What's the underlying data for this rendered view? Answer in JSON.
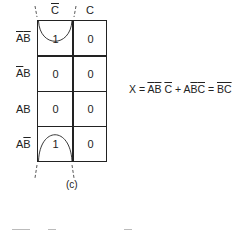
{
  "kmap": {
    "column_headers": [
      {
        "text": "C",
        "overbar": true
      },
      {
        "text": "C",
        "overbar": false
      }
    ],
    "row_headers": [
      {
        "parts": [
          {
            "t": "A",
            "bar": true
          },
          {
            "t": "B",
            "bar": true
          }
        ]
      },
      {
        "parts": [
          {
            "t": "A",
            "bar": true
          },
          {
            "t": "B",
            "bar": false
          }
        ]
      },
      {
        "parts": [
          {
            "t": "A",
            "bar": false
          },
          {
            "t": "B",
            "bar": false
          }
        ]
      },
      {
        "parts": [
          {
            "t": "A",
            "bar": false
          },
          {
            "t": "B",
            "bar": true
          }
        ]
      }
    ],
    "cells": [
      [
        "1",
        "0"
      ],
      [
        "0",
        "0"
      ],
      [
        "0",
        "0"
      ],
      [
        "1",
        "0"
      ]
    ],
    "grouping": "wrap-around loop of C-bar column cells in rows 1 and 4",
    "caption": "(c)"
  },
  "equation": {
    "lhs": "X",
    "eq1": "=",
    "term1": [
      {
        "t": "A",
        "bar": true
      },
      {
        "t": "B",
        "bar": true
      },
      {
        "t": "C",
        "bar": true
      }
    ],
    "plus": "+",
    "term2": [
      {
        "t": "A",
        "bar": false
      },
      {
        "t": "B",
        "bar": true
      },
      {
        "t": "C",
        "bar": true
      }
    ],
    "eq2": "=",
    "result": [
      {
        "t": "B",
        "bar": true
      },
      {
        "t": "C",
        "bar": true
      }
    ]
  }
}
